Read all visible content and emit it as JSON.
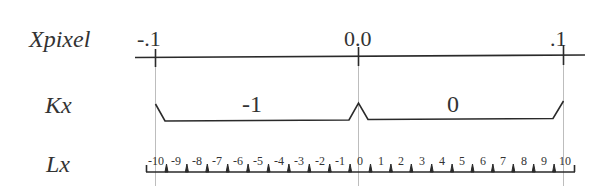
{
  "rows": {
    "xpixel": "Xpixel",
    "kx": "Kx",
    "lx": "Lx"
  },
  "xpixel_ticks": [
    "-.1",
    "0.0",
    ".1"
  ],
  "kx_segments": [
    "-1",
    "0"
  ],
  "lx_ruler": {
    "labels": [
      "-10",
      "-9",
      "-8",
      "-7",
      "-6",
      "-5",
      "-4",
      "-3",
      "-2",
      "-1",
      "0",
      "1",
      "2",
      "3",
      "4",
      "5",
      "6",
      "7",
      "8",
      "9",
      "10"
    ]
  },
  "colors": {
    "line": "#2a2a2a",
    "guide": "#bdbdbd"
  }
}
